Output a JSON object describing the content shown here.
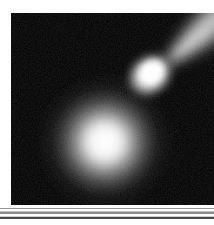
{
  "page": {
    "background_color": "#ffffff",
    "width": 214,
    "height": 225
  },
  "photo": {
    "alt_text": "Comet with bright teardrop head and long diagonal tail beside a large diffuse glowing nebula",
    "background_color": "#000000",
    "frame": {
      "x": 11,
      "y": 13,
      "width": 203,
      "height": 192
    }
  },
  "objects": [
    {
      "name": "comet",
      "label": "comet",
      "head": {
        "center_x": 140,
        "center_y": 60,
        "radius_x": 26,
        "radius_y": 21,
        "rotation_deg": -40,
        "core_color": "#ffffff",
        "halo_color": "#d8d8d8"
      },
      "tail": {
        "origin_x": 150,
        "origin_y": 55,
        "angle_deg": -40,
        "length": 170,
        "width": 40,
        "color": "#f2f2f2",
        "direction": "upper-right"
      }
    },
    {
      "name": "nebula-glow",
      "label": "diffuse glow",
      "center_x": 94,
      "center_y": 129,
      "core_radius": 22,
      "halo_radius": 78,
      "core_color": "#fbfbfb",
      "halo_color": "#8f8f8f"
    }
  ],
  "divider": {
    "name": "horizontal-rule",
    "y": 208,
    "height": 13,
    "colors": [
      "#9a9a9a",
      "#fdfdfd",
      "#bdbdbd",
      "#8a8a8a",
      "#ffffff",
      "#cfcfcf",
      "#4a4a4a",
      "#ffffff"
    ]
  }
}
